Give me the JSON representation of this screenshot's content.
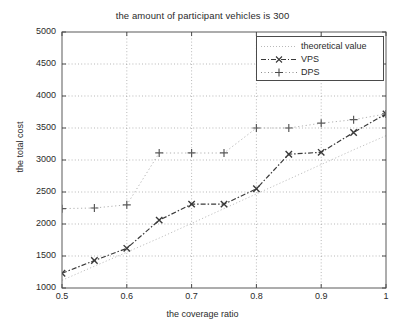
{
  "chart_data": {
    "type": "line",
    "title": "the amount of participant vehicles is 300",
    "xlabel": "the coverage ratio",
    "ylabel": "the total cost",
    "xlim": [
      0.5,
      1.0
    ],
    "ylim": [
      1000,
      5000
    ],
    "xticks": [
      "0.5",
      "0.6",
      "0.7",
      "0.8",
      "0.9",
      "1"
    ],
    "xtick_values": [
      0.5,
      0.6,
      0.7,
      0.8,
      0.9,
      1.0
    ],
    "yticks": [
      "1000",
      "1500",
      "2000",
      "2500",
      "3000",
      "3500",
      "4000",
      "4500",
      "5000"
    ],
    "ytick_values": [
      1000,
      1500,
      2000,
      2500,
      3000,
      3500,
      4000,
      4500,
      5000
    ],
    "grid": true,
    "legend_position": "upper right",
    "legend": [
      "theoretical value",
      "VPS",
      "DPS"
    ],
    "x": [
      0.5,
      0.55,
      0.6,
      0.65,
      0.7,
      0.75,
      0.8,
      0.85,
      0.9,
      0.95,
      1.0
    ],
    "series": [
      {
        "name": "theoretical value",
        "style": "dotted-light",
        "marker": "none",
        "color": "#b9b9b9",
        "values": [
          1120,
          1340,
          1560,
          1780,
          2010,
          2240,
          2470,
          2700,
          2930,
          3160,
          3380
        ]
      },
      {
        "name": "VPS",
        "style": "dash-dot",
        "marker": "x",
        "color": "#3a3a3a",
        "values": [
          1230,
          1430,
          1620,
          2060,
          2310,
          2310,
          2550,
          3090,
          3120,
          3430,
          3720
        ]
      },
      {
        "name": "DPS",
        "style": "dotted",
        "marker": "plus",
        "color": "#5a5a5a",
        "values": [
          2240,
          2250,
          2300,
          3110,
          3110,
          3110,
          3500,
          3500,
          3575,
          3630,
          3720
        ]
      }
    ]
  }
}
